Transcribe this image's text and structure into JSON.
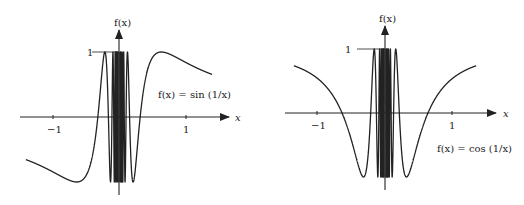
{
  "chart_data": [
    {
      "type": "line",
      "title": "f(x) = sin (1/x)",
      "function": "sin(1/x)",
      "xlabel": "x",
      "ylabel": "f(x)",
      "xlim": [
        -1.4,
        1.4
      ],
      "ylim": [
        -1,
        1
      ],
      "xticks": [
        -1,
        1
      ],
      "xtick_labels": [
        "−1",
        "1"
      ],
      "yticks": [
        1
      ],
      "ytick_labels": [
        "1"
      ],
      "grid": false,
      "annotation": "f(x) = sin (1/x)",
      "series": [
        {
          "name": "sin(1/x)",
          "x_range": [
            -1.4,
            1.4
          ]
        }
      ]
    },
    {
      "type": "line",
      "title": "f(x) = cos (1/x)",
      "function": "cos(1/x)",
      "xlabel": "x",
      "ylabel": "f(x)",
      "xlim": [
        -1.35,
        1.35
      ],
      "ylim": [
        -1,
        1
      ],
      "xticks": [
        -1,
        1
      ],
      "xtick_labels": [
        "−1",
        "1"
      ],
      "yticks": [
        1
      ],
      "ytick_labels": [
        "1"
      ],
      "grid": false,
      "annotation": "f(x) = cos (1/x)",
      "series": [
        {
          "name": "cos(1/x)",
          "x_range": [
            -1.35,
            1.35
          ]
        }
      ]
    }
  ],
  "plots": {
    "left": {
      "ylabel": "f(x)",
      "xlabel": "x",
      "tick_neg": "−1",
      "tick_pos": "1",
      "ytick": "1",
      "annotation": "f(x) = sin (1/x)"
    },
    "right": {
      "ylabel": "f(x)",
      "xlabel": "x",
      "tick_neg": "−1",
      "tick_pos": "1",
      "ytick": "1",
      "annotation": "f(x) = cos (1/x)"
    }
  },
  "style": {
    "ink": "#222222",
    "background": "#ffffff"
  }
}
